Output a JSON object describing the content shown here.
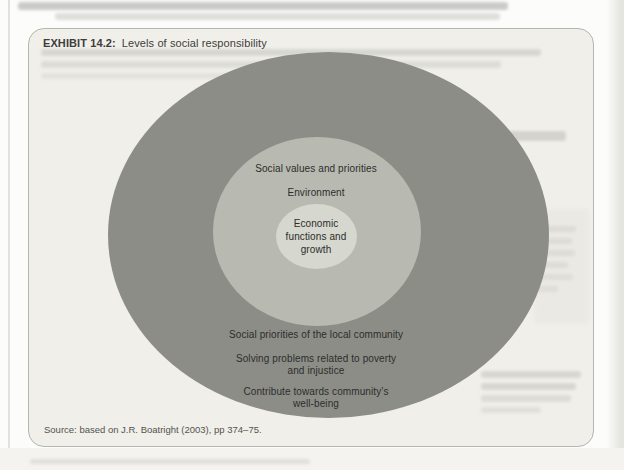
{
  "exhibit": {
    "label": "EXHIBIT 14.2:",
    "title": "Levels of social responsibility",
    "source": "Source: based on J.R. Boatright (2003), pp 374–75."
  },
  "diagram": {
    "type": "concentric-rings",
    "rings": {
      "outer": {
        "name": "Community / societal level",
        "color": "#8c8d87",
        "label_lines": [
          [
            "Social priorities of the local community"
          ],
          [
            "Solving problems related to poverty",
            "and injustice"
          ],
          [
            "Contribute towards community’s",
            "well-being"
          ]
        ]
      },
      "middle": {
        "name": "Societal values level",
        "color": "#b8b9b1",
        "label_lines": [
          [
            "Social values and priorities"
          ],
          [
            "Environment"
          ]
        ]
      },
      "inner": {
        "name": "Economic level",
        "color": "#d6d7cf",
        "label_lines": [
          [
            "Economic",
            "functions and",
            "growth"
          ]
        ]
      }
    },
    "text_color": "#2d2d2b"
  }
}
